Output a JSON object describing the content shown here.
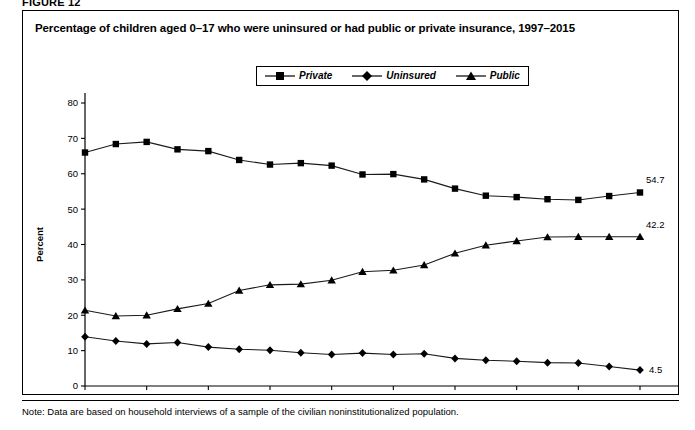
{
  "figure": {
    "label": "FIGURE 12",
    "title": "Percentage of children aged 0–17 who were uninsured or had public or private insurance, 1997–2015",
    "note": "Note: Data are based on household interviews of a sample of the civilian noninstitutionalized population."
  },
  "legend": {
    "position": "top-center",
    "items": [
      {
        "label": "Private",
        "marker": "square-marker",
        "color": "#000000"
      },
      {
        "label": "Uninsured",
        "marker": "diamond-marker",
        "color": "#000000"
      },
      {
        "label": "Public",
        "marker": "triangle-marker",
        "color": "#000000"
      }
    ]
  },
  "axes": {
    "y_label": "Percent",
    "y_ticks": [
      "0",
      "10",
      "20",
      "30",
      "40",
      "50",
      "60",
      "70",
      "80"
    ],
    "x_ticks": [
      "1997",
      "1999",
      "2001",
      "2003",
      "2005",
      "2007",
      "2009",
      "2011",
      "2013",
      "2015"
    ]
  },
  "end_labels": {
    "private": "54.7",
    "public": "42.2",
    "uninsured": "4.5"
  },
  "chart_data": {
    "type": "line",
    "title": "Percentage of children aged 0–17 who were uninsured or had public or private insurance, 1997–2015",
    "xlabel": "",
    "ylabel": "Percent",
    "xlim": [
      1997,
      2015
    ],
    "ylim": [
      0,
      80
    ],
    "ytick_interval": 10,
    "xtick_interval": 2,
    "grid": false,
    "legend_position": "top-center",
    "x": [
      1997,
      1998,
      1999,
      2000,
      2001,
      2002,
      2003,
      2004,
      2005,
      2006,
      2007,
      2008,
      2009,
      2010,
      2011,
      2012,
      2013,
      2014,
      2015
    ],
    "series": [
      {
        "name": "Private",
        "marker": "square",
        "values": [
          66.0,
          68.4,
          69.0,
          66.9,
          66.4,
          63.9,
          62.6,
          63.0,
          62.3,
          59.8,
          59.9,
          58.4,
          55.8,
          53.8,
          53.4,
          52.8,
          52.6,
          53.7,
          54.7
        ]
      },
      {
        "name": "Uninsured",
        "marker": "diamond",
        "values": [
          13.9,
          12.7,
          11.9,
          12.3,
          11.0,
          10.4,
          10.1,
          9.4,
          8.9,
          9.3,
          8.9,
          9.1,
          7.8,
          7.3,
          7.0,
          6.6,
          6.5,
          5.5,
          4.5
        ]
      },
      {
        "name": "Public",
        "marker": "triangle",
        "values": [
          21.4,
          19.8,
          20.0,
          21.8,
          23.3,
          27.0,
          28.6,
          28.8,
          29.9,
          32.3,
          32.7,
          34.2,
          37.5,
          39.8,
          41.0,
          42.1,
          42.2,
          42.2,
          42.2
        ]
      }
    ],
    "annotations": [
      {
        "series": "Private",
        "x": 2015,
        "y": 54.7,
        "text": "54.7"
      },
      {
        "series": "Public",
        "x": 2015,
        "y": 42.2,
        "text": "42.2"
      },
      {
        "series": "Uninsured",
        "x": 2015,
        "y": 4.5,
        "text": "4.5"
      }
    ]
  }
}
